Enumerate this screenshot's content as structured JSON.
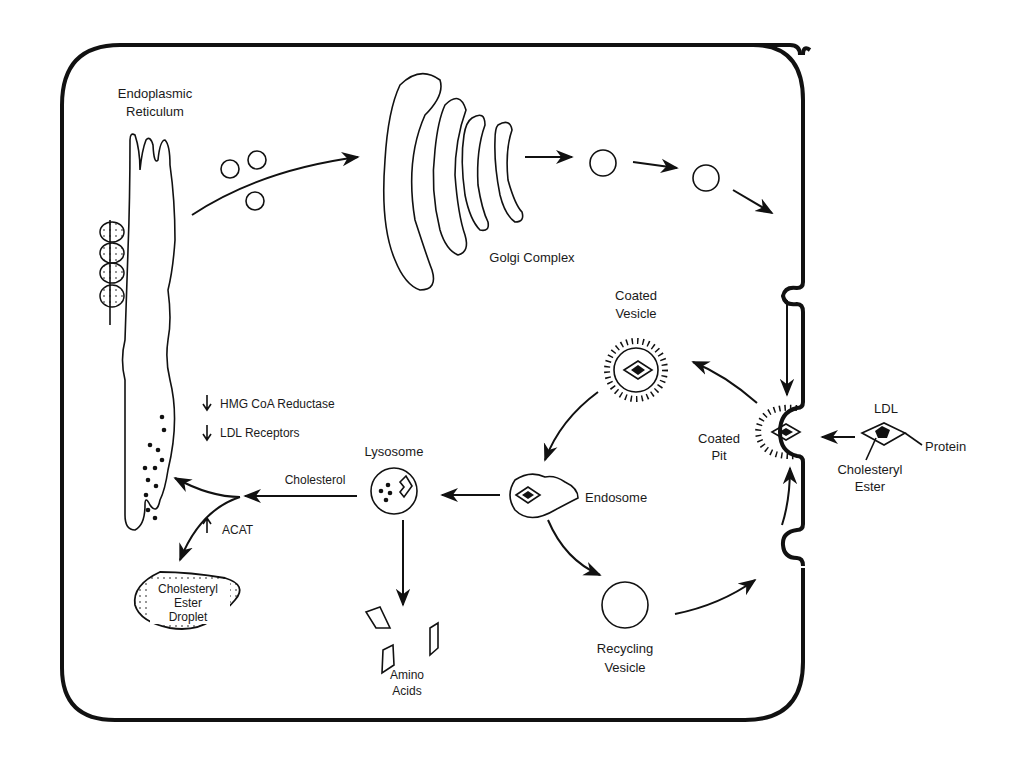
{
  "diagram": {
    "type": "cell-pathway",
    "labels": {
      "er": [
        "Endoplasmic",
        "Reticulum"
      ],
      "golgi": "Golgi Complex",
      "coated_vesicle": [
        "Coated",
        "Vesicle"
      ],
      "coated_pit": [
        "Coated",
        "Pit"
      ],
      "ldl": "LDL",
      "protein": "Protein",
      "cholesteryl_ester": [
        "Cholesteryl",
        "Ester"
      ],
      "endosome": "Endosome",
      "lysosome": "Lysosome",
      "cholesterol": "Cholesterol",
      "hmg": "HMG CoA Reductase",
      "ldl_receptors": "LDL Receptors",
      "acat": "ACAT",
      "droplet": [
        "Cholesteryl",
        "Ester",
        "Droplet"
      ],
      "amino_acids": [
        "Amino",
        "Acids"
      ],
      "recycling_vesicle": [
        "Recycling",
        "Vesicle"
      ]
    },
    "regulation": [
      {
        "target": "HMG CoA Reductase",
        "direction": "down"
      },
      {
        "target": "LDL Receptors",
        "direction": "down"
      },
      {
        "target": "ACAT",
        "direction": "up"
      }
    ],
    "flow": [
      "Endoplasmic Reticulum -> Golgi Complex",
      "Golgi Complex -> vesicles -> cell surface",
      "LDL -> Coated Pit",
      "Coated Pit -> Coated Vesicle",
      "Coated Vesicle -> Endosome",
      "Endosome -> Lysosome",
      "Endosome -> Recycling Vesicle -> cell surface",
      "Lysosome -> Cholesterol -> ER / Cholesteryl Ester Droplet",
      "Lysosome -> Amino Acids"
    ]
  }
}
